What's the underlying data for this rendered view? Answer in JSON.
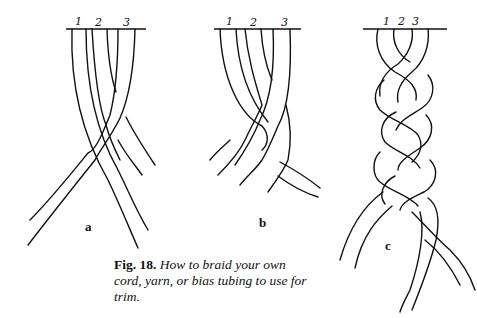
{
  "figure": {
    "number": "Fig. 18.",
    "caption": "How to braid your own cord, yarn, or bias tubing to use for trim."
  },
  "panels": [
    {
      "label": "a",
      "strand_numbers": [
        "1",
        "2",
        "3"
      ]
    },
    {
      "label": "b",
      "strand_numbers": [
        "1",
        "2",
        "3"
      ]
    },
    {
      "label": "c",
      "strand_numbers": [
        "1",
        "2",
        "3"
      ]
    }
  ],
  "colors": {
    "ink": "#111111",
    "background": "#ffffff"
  }
}
